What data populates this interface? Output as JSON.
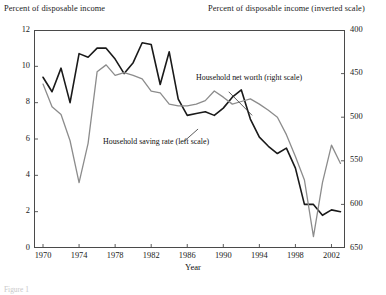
{
  "titles": {
    "left_axis": "Percent of disposable income",
    "right_axis": "Percent of disposable income (inverted scale)",
    "xaxis": "Year"
  },
  "caption": "Figure 1",
  "annotations": {
    "net_worth": "Household net worth (right scale)",
    "saving_rate": "Household saving rate (left scale)"
  },
  "chart_data": {
    "type": "line",
    "title": "",
    "xlabel": "Year",
    "ylabel": "Percent of disposable income",
    "ylabel_right": "Percent of disposable income (inverted scale)",
    "xlim": [
      1969,
      2003.5
    ],
    "ylim": [
      0,
      12
    ],
    "ylim_right": [
      650,
      400
    ],
    "right_axis_inverted": true,
    "grid": false,
    "legend": "annotations",
    "yticks": [
      0,
      2,
      4,
      6,
      8,
      10,
      12
    ],
    "yticks_right": [
      400,
      450,
      500,
      550,
      600,
      650
    ],
    "xticks": [
      1970,
      1974,
      1978,
      1982,
      1986,
      1990,
      1994,
      1998,
      2002
    ],
    "x": [
      1970,
      1971,
      1972,
      1973,
      1974,
      1975,
      1976,
      1977,
      1978,
      1979,
      1980,
      1981,
      1982,
      1983,
      1984,
      1985,
      1986,
      1987,
      1988,
      1989,
      1990,
      1991,
      1992,
      1993,
      1994,
      1995,
      1996,
      1997,
      1998,
      1999,
      2000,
      2001,
      2002,
      2003
    ],
    "series": [
      {
        "name": "Household saving rate (left scale)",
        "axis": "left",
        "color": "#1a1a1a",
        "width": 1.6,
        "units": "percent of disposable income",
        "values": [
          9.4,
          8.6,
          9.9,
          8.0,
          10.7,
          10.5,
          11.0,
          11.0,
          10.4,
          9.6,
          10.2,
          11.3,
          11.2,
          9.0,
          10.8,
          8.2,
          7.3,
          7.4,
          7.5,
          7.3,
          7.7,
          8.3,
          8.7,
          7.1,
          6.1,
          5.6,
          5.2,
          5.5,
          4.4,
          2.4,
          2.4,
          1.8,
          2.1,
          2.0
        ]
      },
      {
        "name": "Household net worth (right scale)",
        "axis": "right",
        "color": "#8c8c8c",
        "width": 1.3,
        "units": "percent of disposable income (inverted)",
        "values": [
          462,
          488,
          497,
          527,
          575,
          530,
          448,
          440,
          452,
          449,
          452,
          456,
          470,
          472,
          485,
          487,
          487,
          485,
          481,
          470,
          477,
          485,
          482,
          479,
          485,
          492,
          500,
          520,
          545,
          572,
          637,
          575,
          532,
          553
        ]
      }
    ],
    "annotations": [
      {
        "text": "Household net worth (right scale)",
        "x": 1989.0,
        "y": 9.05,
        "leader_from": [
          1990.6,
          8.6
        ],
        "leader_to": [
          1993.2,
          7.3
        ]
      },
      {
        "text": "Household saving rate (left scale)",
        "x": 1976.4,
        "y": 5.45,
        "leader_from": [
          1985.6,
          5.85
        ],
        "leader_to": [
          1987.2,
          6.55
        ]
      }
    ]
  }
}
